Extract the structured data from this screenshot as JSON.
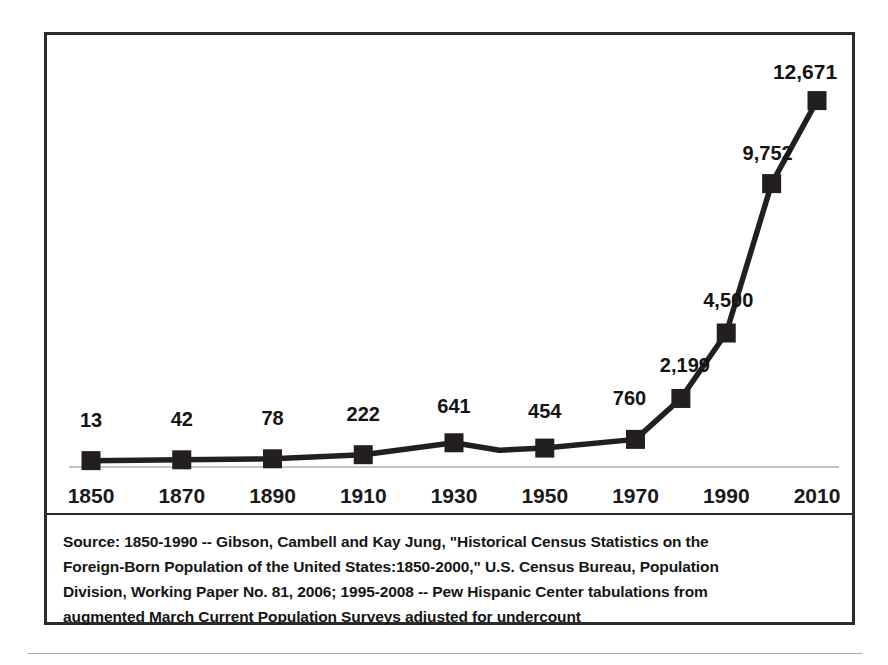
{
  "figure": {
    "axis_label_years": [
      "1850",
      "1870",
      "1890",
      "1910",
      "1930",
      "1950",
      "1970",
      "1990",
      "2010"
    ],
    "source_note_lines": [
      "Source: 1850-1990 -- Gibson, Cambell and Kay Jung, \"Historical Census Statistics on the",
      "Foreign-Born Population of the United States:1850-2000,\" U.S. Census  Bureau, Population",
      "Division, Working Paper No. 81, 2006; 1995-2008 -- Pew Hispanic Center tabulations from",
      "augmented March Current Population Surveys adjusted for undercount"
    ],
    "colors": {
      "line": "#231f20",
      "marker": "#231f20",
      "frame": "#2b2b2b",
      "baseline": "#b0b0b0",
      "text": "#161616"
    }
  },
  "chart_data": {
    "type": "line",
    "title": "",
    "subtitle": "",
    "xlabel": "",
    "ylabel": "",
    "grid": false,
    "legend": "none",
    "xlim": [
      1850,
      2010
    ],
    "ylim": [
      0,
      13500
    ],
    "x_tick_labels": [
      "1850",
      "1870",
      "1890",
      "1910",
      "1930",
      "1950",
      "1970",
      "1990",
      "2010"
    ],
    "x_ticks": [
      1850,
      1870,
      1890,
      1910,
      1930,
      1950,
      1970,
      1990,
      2010
    ],
    "y_tick_labels": [],
    "series": [
      {
        "name": "Foreign-born population (thousands)",
        "x": [
          1850,
          1870,
          1890,
          1910,
          1930,
          1940,
          1950,
          1970,
          1980,
          1990,
          2000,
          2010
        ],
        "values": [
          13,
          42,
          78,
          222,
          641,
          380,
          454,
          760,
          2199,
          4500,
          9752,
          12671
        ],
        "marker": "square",
        "markers_shown": [
          1850,
          1870,
          1890,
          1910,
          1930,
          1950,
          1970,
          1980,
          1990,
          2000,
          2010
        ]
      }
    ],
    "data_labels": [
      {
        "x": 1850,
        "value": 13,
        "text": "13",
        "emphasis": false
      },
      {
        "x": 1870,
        "value": 42,
        "text": "42",
        "emphasis": false
      },
      {
        "x": 1890,
        "value": 78,
        "text": "78",
        "emphasis": false
      },
      {
        "x": 1910,
        "value": 222,
        "text": "222",
        "emphasis": false
      },
      {
        "x": 1930,
        "value": 641,
        "text": "641",
        "emphasis": false
      },
      {
        "x": 1950,
        "value": 454,
        "text": "454",
        "emphasis": false
      },
      {
        "x": 1970,
        "value": 760,
        "text": "760",
        "emphasis": false
      },
      {
        "x": 1980,
        "value": 2199,
        "text": "2,199",
        "emphasis": false
      },
      {
        "x": 1990,
        "value": 4500,
        "text": "4,500",
        "emphasis": false
      },
      {
        "x": 2000,
        "value": 9752,
        "text": "9,752",
        "emphasis": false
      },
      {
        "x": 2010,
        "value": 12671,
        "text": "12,671",
        "emphasis": true
      }
    ]
  }
}
